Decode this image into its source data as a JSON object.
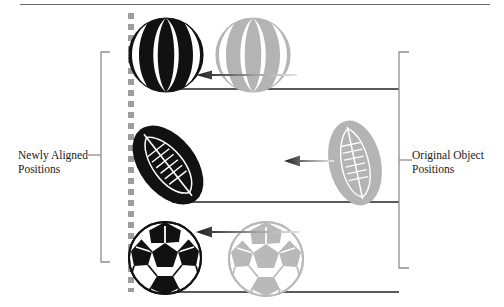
{
  "figure": {
    "background_color": "#ffffff",
    "width": 504,
    "height": 307
  },
  "labels": {
    "left": "Newly Aligned\nPositions",
    "right": "Original Object\nPositions"
  },
  "colors": {
    "aligned_object": "#111111",
    "original_object": "#b4b4b4",
    "original_object_shade": "#9a9a9a",
    "bracket": "#8e8e8e",
    "alignment_guide": "#9d9d9d",
    "baseline": "#222222",
    "arrow_dark": "#1c1c1c",
    "arrow_light": "#dedede",
    "rule": "#6a6a6a",
    "text": "#1a1a1a"
  },
  "alignment_guide": {
    "name": "alignment-axis",
    "style": "dashed",
    "x": 131,
    "y_start": 13,
    "y_end": 292,
    "dash_length": 6,
    "gap_length": 5,
    "thickness": 6
  },
  "brackets": {
    "left": {
      "x": 101,
      "y_top": 52,
      "y_bottom": 262,
      "tick_length": 9,
      "leader_y": 155,
      "leader_to_x": 104
    },
    "right": {
      "x": 399,
      "y_top": 52,
      "y_bottom": 268,
      "tick_length": 10,
      "leader_y": 160,
      "leader_to_x": 410
    }
  },
  "rows": [
    {
      "name": "beachball-row",
      "object_type": "beach-ball",
      "aligned": {
        "cx": 166,
        "cy": 55,
        "rx": 36,
        "ry": 38,
        "color": "#111111"
      },
      "original": {
        "cx": 253,
        "cy": 55,
        "rx": 36,
        "ry": 38,
        "color": "#b4b4b4"
      },
      "arrow": {
        "x_tail": 297,
        "x_head": 196,
        "y": 74
      },
      "baseline": {
        "x_start": 166,
        "x_end": 399,
        "y": 89
      }
    },
    {
      "name": "football-row",
      "object_type": "football",
      "aligned": {
        "cx": 168,
        "cy": 165,
        "rx": 28,
        "ry": 44,
        "rotation": -38,
        "color": "#111111"
      },
      "original": {
        "cx": 355,
        "cy": 163,
        "rx": 26,
        "ry": 42,
        "rotation": -12,
        "color": "#b4b4b4"
      },
      "arrow": {
        "x_tail": 334,
        "x_head": 284,
        "y": 160
      },
      "baseline": {
        "x_start": 172,
        "x_end": 399,
        "y": 202
      }
    },
    {
      "name": "soccerball-row",
      "object_type": "soccer-ball",
      "aligned": {
        "cx": 165,
        "cy": 258,
        "r": 37,
        "color": "#111111"
      },
      "original": {
        "cx": 266,
        "cy": 259,
        "r": 38,
        "color": "#b9b9b9"
      },
      "arrow": {
        "x_tail": 300,
        "x_head": 196,
        "y": 231
      },
      "baseline": {
        "x_start": 162,
        "x_end": 399,
        "y": 292
      }
    }
  ]
}
